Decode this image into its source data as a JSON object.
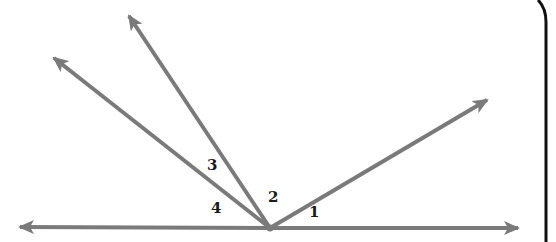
{
  "diagram": {
    "type": "angles-at-a-point-on-a-line",
    "colors": {
      "ray": "#7a7a7a",
      "label": "#1a1a1a",
      "bracket": "#111111",
      "background": "#ffffff"
    },
    "vertex": {
      "x": 270,
      "y": 228
    },
    "line": {
      "left_arrow": {
        "x": 18,
        "y": 227
      },
      "right_arrow": {
        "x": 520,
        "y": 228
      }
    },
    "rays": [
      {
        "name": "ray-upper-right",
        "tip": {
          "x": 489,
          "y": 99
        }
      },
      {
        "name": "ray-upper-left-steep",
        "tip": {
          "x": 128,
          "y": 14
        }
      },
      {
        "name": "ray-upper-left-shallow",
        "tip": {
          "x": 52,
          "y": 57
        }
      }
    ],
    "angle_labels": [
      {
        "text": "1",
        "x": 309,
        "y": 205
      },
      {
        "text": "2",
        "x": 268,
        "y": 190
      },
      {
        "text": "3",
        "x": 207,
        "y": 158
      },
      {
        "text": "4",
        "x": 211,
        "y": 201
      }
    ]
  }
}
